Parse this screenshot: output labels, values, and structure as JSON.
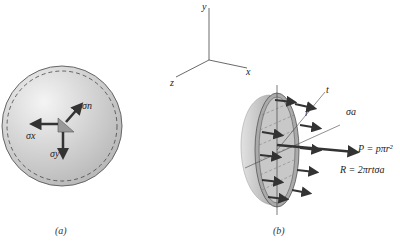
{
  "figure_a": {
    "caption": "(a)",
    "labels": {
      "sigma_n": "σn",
      "sigma_x": "σx",
      "sigma_y": "σy"
    }
  },
  "figure_b": {
    "caption": "(b)",
    "axes": {
      "x": "x",
      "y": "y",
      "z": "z"
    },
    "labels": {
      "t": "t",
      "r": "r",
      "sigma_a": "σa",
      "P": "P = pπr²",
      "R": "R = 2πrtσa"
    }
  }
}
